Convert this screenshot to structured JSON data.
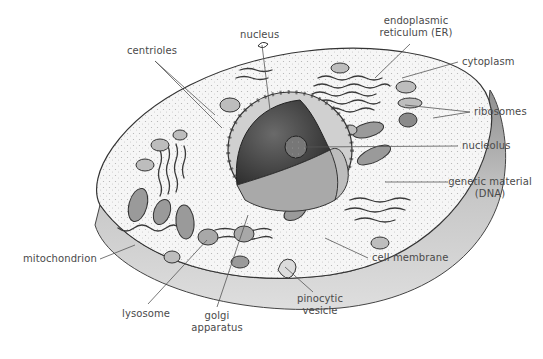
{
  "diagram": {
    "type": "labeled-illustration",
    "labels": {
      "centrioles": "centrioles",
      "nucleus": "nucleus",
      "er_line1": "endoplasmic",
      "er_line2": "reticulum (ER)",
      "cytoplasm": "cytoplasm",
      "ribosomes": "ribosomes",
      "nucleolus": "nucleolus",
      "dna_line1": "genetic material",
      "dna_line2": "(DNA)",
      "mitochondrion": "mitochondrion",
      "cell_membrane": "cell membrane",
      "lysosome": "lysosome",
      "golgi_line1": "golgi",
      "golgi_line2": "apparatus",
      "pinocytic_line1": "pinocytic",
      "pinocytic_line2": "vesicle"
    },
    "colors": {
      "background": "#ffffff",
      "ink": "#333333",
      "label_text": "#4a4a4a",
      "cytoplasm_fill": "#f4f4f4",
      "membrane_side": "#bdbdbd",
      "nucleus_dark": "#4a4a4a",
      "dna_fill": "#a9a9a9"
    }
  }
}
